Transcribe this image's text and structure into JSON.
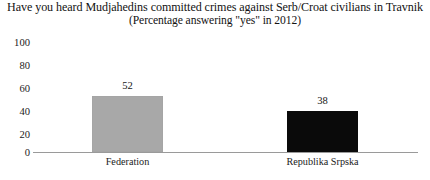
{
  "chart_data": {
    "type": "bar",
    "title": "Have you heard Mudjahedins committed crimes against Serb/Croat civilians in Travnik",
    "subtitle": "(Percentage answering \"yes\" in 2012)",
    "xlabel": "",
    "ylabel": "",
    "ylim": [
      0,
      100
    ],
    "yticks": [
      "100",
      "80",
      "60",
      "40",
      "20",
      "0"
    ],
    "grid": false,
    "legend": "none",
    "categories": [
      "Federation",
      "Republika Srpska"
    ],
    "values": [
      52,
      38
    ],
    "value_labels": [
      "52",
      "38"
    ],
    "bar_colors": [
      "#a8a8a8",
      "#0a0a0a"
    ],
    "axis_color": "#9a9a9a"
  }
}
